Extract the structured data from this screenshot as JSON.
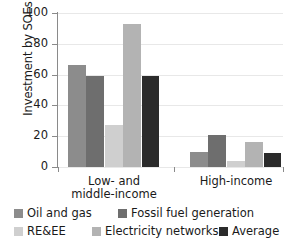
{
  "chart_data": {
    "type": "bar",
    "title": "",
    "xlabel": "",
    "ylabel": "Investment by SOEs (%)",
    "ylim": [
      0,
      100
    ],
    "yticks": [
      0,
      20,
      40,
      60,
      80,
      100
    ],
    "ytick_labels": [
      "0",
      "20",
      "40",
      "60",
      "80",
      "100"
    ],
    "grid": true,
    "legend_position": "bottom",
    "categories": [
      "Low- and\nmiddle-income",
      "High-income"
    ],
    "category_labels_flat": [
      "Low- and middle-income",
      "High-income"
    ],
    "series": [
      {
        "name": "Oil and gas",
        "color": "#8c8c8c",
        "values": [
          66,
          10
        ]
      },
      {
        "name": "Fossil fuel generation",
        "color": "#6e6e6e",
        "values": [
          59,
          21
        ]
      },
      {
        "name": "RE&EE",
        "color": "#cfcfcf",
        "values": [
          27,
          4
        ]
      },
      {
        "name": "Electricity networks",
        "color": "#b3b3b3",
        "values": [
          93,
          16
        ]
      },
      {
        "name": "Average",
        "color": "#2b2b2b",
        "values": [
          59,
          9
        ]
      }
    ]
  },
  "legend": {
    "items": [
      {
        "label": "Oil and gas",
        "color": "#8c8c8c"
      },
      {
        "label": "Fossil fuel generation",
        "color": "#6e6e6e"
      },
      {
        "label": "RE&EE",
        "color": "#cfcfcf"
      },
      {
        "label": "Electricity networks",
        "color": "#b3b3b3"
      },
      {
        "label": "Average",
        "color": "#2b2b2b"
      }
    ]
  },
  "colors": {
    "axis": "#8a8a8a",
    "grid": "#e8e8e8",
    "text": "#1a1a1a",
    "background": "#ffffff"
  }
}
